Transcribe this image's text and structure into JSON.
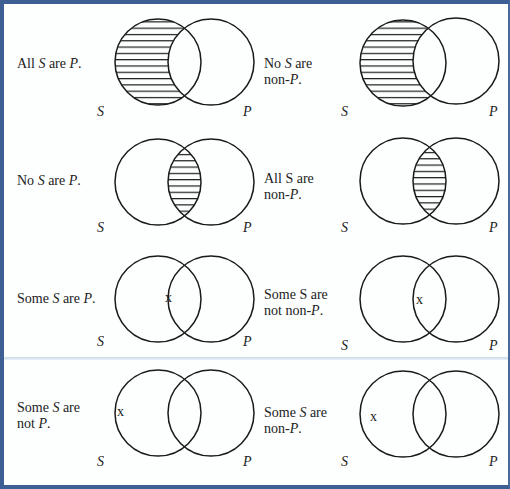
{
  "diagrams": [
    {
      "id": "A",
      "line1": "All S are P.",
      "line1_parts": [
        "All ",
        "S",
        " are ",
        "P",
        "."
      ],
      "line2": "",
      "shading": "s-only",
      "x_mark": "",
      "s_label": "S",
      "p_label": "P"
    },
    {
      "id": "A-obv",
      "line1": "No S are",
      "line2": "non-P.",
      "shading": "s-only",
      "x_mark": "",
      "s_label": "S",
      "p_label": "P"
    },
    {
      "id": "E",
      "line1": "No S are P.",
      "line2": "",
      "shading": "intersection",
      "x_mark": "",
      "s_label": "S",
      "p_label": "P"
    },
    {
      "id": "E-obv",
      "line1": "All S are",
      "line2": "non-P.",
      "shading": "intersection",
      "x_mark": "",
      "s_label": "S",
      "p_label": "P"
    },
    {
      "id": "I",
      "line1": "Some S are P.",
      "line2": "",
      "shading": "none",
      "x_mark": "x",
      "x_region": "intersection",
      "s_label": "S",
      "p_label": "P"
    },
    {
      "id": "I-obv",
      "line1": "Some S are",
      "line2": "not non-P.",
      "shading": "none",
      "x_mark": "x",
      "x_region": "intersection",
      "s_label": "S",
      "p_label": "P"
    },
    {
      "id": "O",
      "line1": "Some S are",
      "line2": "not P.",
      "shading": "none",
      "x_mark": "x",
      "x_region": "s-only",
      "s_label": "S",
      "p_label": "P"
    },
    {
      "id": "O-obv",
      "line1": "Some S are",
      "line2": "non-P.",
      "shading": "none",
      "x_mark": "x",
      "x_region": "s-only",
      "s_label": "S",
      "p_label": "P"
    }
  ],
  "text": {
    "d0": {
      "a": "All ",
      "b": "S",
      "c": " are ",
      "d": "P",
      "e": "."
    },
    "d1": {
      "a": "No ",
      "b": "S",
      "c": " are",
      "l2a": "non-",
      "l2b": "P",
      "l2c": "."
    },
    "d2": {
      "a": "No ",
      "b": "S",
      "c": " are ",
      "d": "P",
      "e": "."
    },
    "d3": {
      "a": "All S are",
      "l2a": "non-",
      "l2b": "P",
      "l2c": "."
    },
    "d4": {
      "a": "Some ",
      "b": "S",
      "c": " are ",
      "d": "P",
      "e": "."
    },
    "d5": {
      "a": "Some S are",
      "l2a": "not non-",
      "l2b": "P",
      "l2c": "."
    },
    "d6": {
      "a": "Some ",
      "b": "S",
      "c": " are",
      "l2a": "not ",
      "l2b": "P",
      "l2c": "."
    },
    "d7": {
      "a": "Some ",
      "b": "S",
      "c": " are",
      "l2a": "non-",
      "l2b": "P",
      "l2c": "."
    }
  },
  "letters": {
    "s": "S",
    "p": "P",
    "x": "x"
  },
  "colors": {
    "frame": "#3d5f93",
    "stroke": "#1a1a1a",
    "separator": "#c9dbe9"
  }
}
